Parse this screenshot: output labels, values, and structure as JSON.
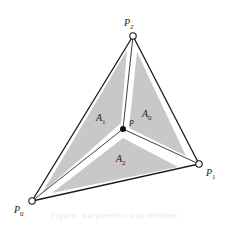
{
  "diagram": {
    "colors": {
      "region_fill": "#c8c8c8",
      "edge": "#1a1a1a",
      "inner_line": "#2a2a2a",
      "background": "#ffffff"
    },
    "vertices": [
      {
        "id": "P0",
        "label": "P",
        "sub": "0",
        "x": 32,
        "y": 201,
        "label_x": 10,
        "label_y": 213
      },
      {
        "id": "P1",
        "label": "P",
        "sub": "1",
        "x": 199,
        "y": 164,
        "label_x": 206,
        "label_y": 176
      },
      {
        "id": "P2",
        "label": "P",
        "sub": "2",
        "x": 133,
        "y": 36,
        "label_x": 124,
        "label_y": 26
      }
    ],
    "interior_point": {
      "id": "P",
      "label": "P",
      "x": 123,
      "y": 129,
      "label_x": 129,
      "label_y": 126
    },
    "regions": [
      {
        "id": "A0",
        "label": "A",
        "sub": "0",
        "label_x": 142,
        "label_y": 117
      },
      {
        "id": "A1",
        "label": "A",
        "sub": "1",
        "label_x": 96,
        "label_y": 121
      },
      {
        "id": "A2",
        "label": "A",
        "sub": "2",
        "label_x": 116,
        "label_y": 162
      }
    ]
  },
  "caption": "Figure: barycentric coordinates"
}
